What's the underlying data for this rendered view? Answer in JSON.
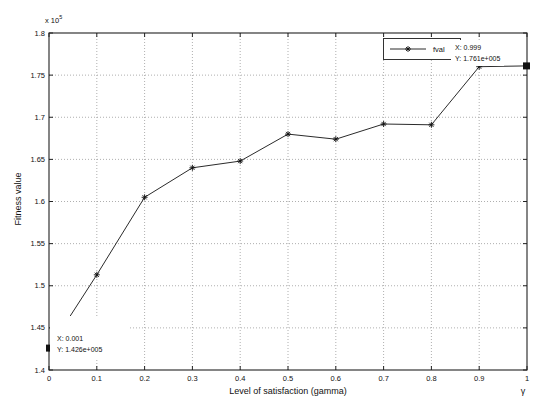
{
  "figure": {
    "legend": {
      "label": "fval"
    },
    "datatips": [
      {
        "line1": "X: 0.001",
        "line2": "Y: 1.426e+005",
        "x": 0.001,
        "y": 142600
      },
      {
        "line1": "X: 0.999",
        "line2": "Y: 1.761e+005",
        "x": 0.999,
        "y": 176100
      }
    ]
  },
  "chart_data": {
    "type": "line",
    "title": "",
    "xlabel": "Level of satisfaction (gamma)",
    "x_axis_symbol": "γ",
    "ylabel": "Fitness value",
    "y_exponent_prefix": "x 10",
    "y_exponent_power": "5",
    "xlim": [
      0,
      1
    ],
    "ylim": [
      140000,
      180000
    ],
    "xticks": [
      "0",
      "0.1",
      "0.2",
      "0.3",
      "0.4",
      "0.5",
      "0.6",
      "0.7",
      "0.8",
      "0.9",
      "1"
    ],
    "yticks": [
      "1.4",
      "1.45",
      "1.5",
      "1.55",
      "1.6",
      "1.65",
      "1.7",
      "1.75",
      "1.8"
    ],
    "grid": "dotted",
    "legend_position": "top-right-inside",
    "series": [
      {
        "name": "fval",
        "marker": "asterisk",
        "endpoint_marker": "filled-square",
        "color": "#2b2b2b",
        "x": [
          0.001,
          0.1,
          0.2,
          0.3,
          0.4,
          0.5,
          0.6,
          0.7,
          0.8,
          0.9,
          0.999
        ],
        "y": [
          142600,
          151300,
          160500,
          164000,
          164800,
          168000,
          167400,
          169200,
          169100,
          176000,
          176100
        ]
      }
    ],
    "colors": {
      "line": "#2b2b2b",
      "grid": "#9a9a9a",
      "axis": "#222222",
      "text": "#111111",
      "datatip_bg": "#ffffff"
    }
  }
}
